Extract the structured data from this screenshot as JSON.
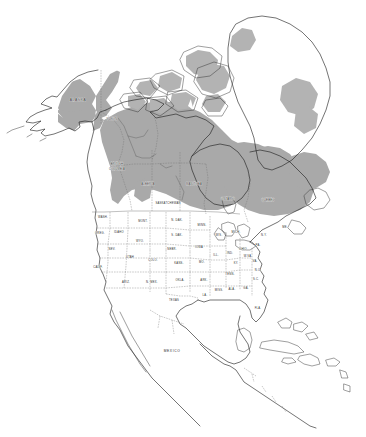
{
  "figure": {
    "type": "range-map",
    "background_color": "#ffffff",
    "width": 366,
    "height": 437
  },
  "legend": {
    "range_shade_color": "#a9a9a9",
    "land_color": "#ffffff",
    "coastline_color": "#1d1d1d",
    "internal_border_color": "#6f6f6f",
    "range_description": "shaded gray area indicates distribution",
    "visible": false
  },
  "labels": {
    "canada_territories": [
      {
        "id": "alaska",
        "text": "ALASKA",
        "x": 78,
        "y": 101,
        "size": "prov"
      },
      {
        "id": "yukon",
        "text": "YUKON",
        "x": 112,
        "y": 120,
        "size": "tiny"
      },
      {
        "id": "british-columbia-1",
        "text": "BRITISH",
        "x": 117,
        "y": 165,
        "size": "tiny"
      },
      {
        "id": "british-columbia-2",
        "text": "COLUMBIA",
        "x": 117,
        "y": 170,
        "size": "tiny"
      },
      {
        "id": "alberta",
        "text": "ALBERTA",
        "x": 148,
        "y": 185,
        "size": "tiny"
      },
      {
        "id": "saskatchewan",
        "text": "SASKATCHEWAN",
        "x": 168,
        "y": 204,
        "size": "tiny"
      },
      {
        "id": "manitoba",
        "text": "MANITOBA",
        "x": 194,
        "y": 185,
        "size": "tiny"
      },
      {
        "id": "ontario",
        "text": "ONTARIO",
        "x": 228,
        "y": 200,
        "size": "tiny"
      },
      {
        "id": "quebec",
        "text": "QUEBEC",
        "x": 268,
        "y": 201,
        "size": "tiny"
      }
    ],
    "countries": [
      {
        "id": "mexico",
        "text": "MEXICO",
        "x": 172,
        "y": 352,
        "size": "prov"
      }
    ],
    "us_states": [
      {
        "id": "washington",
        "text": "WASH.",
        "x": 103,
        "y": 218
      },
      {
        "id": "oregon",
        "text": "OREG.",
        "x": 100,
        "y": 234
      },
      {
        "id": "idaho",
        "text": "IDAHO",
        "x": 119,
        "y": 233
      },
      {
        "id": "montana",
        "text": "MONT.",
        "x": 143,
        "y": 222
      },
      {
        "id": "north-dakota",
        "text": "N. DAK.",
        "x": 177,
        "y": 221
      },
      {
        "id": "south-dakota",
        "text": "S. DAK.",
        "x": 177,
        "y": 236
      },
      {
        "id": "minnesota",
        "text": "MINN.",
        "x": 202,
        "y": 226
      },
      {
        "id": "wisconsin",
        "text": "WIS.",
        "x": 219,
        "y": 236
      },
      {
        "id": "michigan",
        "text": "MICH.",
        "x": 236,
        "y": 233
      },
      {
        "id": "wyoming",
        "text": "WYO.",
        "x": 140,
        "y": 242
      },
      {
        "id": "nebraska",
        "text": "NEBR.",
        "x": 172,
        "y": 250
      },
      {
        "id": "iowa",
        "text": "IOWA",
        "x": 199,
        "y": 248
      },
      {
        "id": "illinois",
        "text": "ILL.",
        "x": 216,
        "y": 256
      },
      {
        "id": "indiana",
        "text": "IND.",
        "x": 230,
        "y": 254
      },
      {
        "id": "ohio",
        "text": "OHIO",
        "x": 243,
        "y": 250
      },
      {
        "id": "nevada",
        "text": "NEV.",
        "x": 112,
        "y": 250
      },
      {
        "id": "utah",
        "text": "UTAH",
        "x": 130,
        "y": 258
      },
      {
        "id": "colorado",
        "text": "COLO.",
        "x": 153,
        "y": 261
      },
      {
        "id": "kansas",
        "text": "KANS.",
        "x": 179,
        "y": 264
      },
      {
        "id": "missouri",
        "text": "MO.",
        "x": 202,
        "y": 263
      },
      {
        "id": "kentucky",
        "text": "KY.",
        "x": 236,
        "y": 264
      },
      {
        "id": "california",
        "text": "CALIF.",
        "x": 98,
        "y": 268
      },
      {
        "id": "arizona",
        "text": "ARIZ.",
        "x": 126,
        "y": 283
      },
      {
        "id": "new-mexico",
        "text": "N. MEX.",
        "x": 152,
        "y": 283
      },
      {
        "id": "oklahoma",
        "text": "OKLA.",
        "x": 180,
        "y": 281
      },
      {
        "id": "arkansas",
        "text": "ARK.",
        "x": 204,
        "y": 281
      },
      {
        "id": "tennessee",
        "text": "TENN.",
        "x": 230,
        "y": 275
      },
      {
        "id": "texas",
        "text": "TEXAS",
        "x": 174,
        "y": 301
      },
      {
        "id": "louisiana",
        "text": "LA.",
        "x": 205,
        "y": 296
      },
      {
        "id": "mississippi",
        "text": "MISS.",
        "x": 219,
        "y": 291
      },
      {
        "id": "alabama",
        "text": "ALA.",
        "x": 232,
        "y": 290
      },
      {
        "id": "georgia",
        "text": "GA.",
        "x": 246,
        "y": 289
      },
      {
        "id": "florida",
        "text": "FLA.",
        "x": 258,
        "y": 309
      },
      {
        "id": "south-carolina",
        "text": "S.C.",
        "x": 256,
        "y": 280
      },
      {
        "id": "north-carolina",
        "text": "N.C.",
        "x": 258,
        "y": 271
      },
      {
        "id": "virginia",
        "text": "VA.",
        "x": 255,
        "y": 262
      },
      {
        "id": "west-virginia",
        "text": "W.VA.",
        "x": 248,
        "y": 257
      },
      {
        "id": "pennsylvania",
        "text": "PA.",
        "x": 258,
        "y": 246
      },
      {
        "id": "new-york",
        "text": "N.Y.",
        "x": 264,
        "y": 236
      },
      {
        "id": "maine",
        "text": "ME.",
        "x": 285,
        "y": 228
      }
    ]
  },
  "geography": {
    "regions_shaded": [
      "Alaska",
      "Yukon",
      "Northwest Territories",
      "Nunavut",
      "northern British Columbia",
      "northern Alberta",
      "northern Saskatchewan",
      "Manitoba",
      "Ontario",
      "Quebec",
      "Labrador",
      "Newfoundland",
      "southwest Greenland coast",
      "east Greenland coast"
    ],
    "regions_unshaded": [
      "contiguous United States",
      "Mexico",
      "Central America",
      "Caribbean islands",
      "Greenland interior ice sheet",
      "southern Prairie provinces"
    ]
  }
}
